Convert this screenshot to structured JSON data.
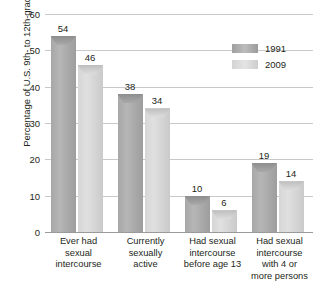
{
  "chart_data": {
    "type": "bar",
    "title": "",
    "xlabel": "",
    "ylabel": "Percentage of U.S. 9th- to 12th-graders",
    "ylim": [
      0,
      60
    ],
    "yticks": [
      0,
      10,
      20,
      30,
      40,
      50,
      60
    ],
    "grid": true,
    "legend_position": "top-right",
    "categories": [
      "Ever had sexual intercourse",
      "Currently sexually active",
      "Had sexual intercourse before age 13",
      "Had sexual intercourse with 4 or more persons"
    ],
    "category_lines": [
      [
        "Ever had",
        "sexual",
        "intercourse"
      ],
      [
        "Currently",
        "sexually",
        "active"
      ],
      [
        "Had sexual",
        "intercourse",
        "before age 13"
      ],
      [
        "Had sexual",
        "intercourse",
        "with 4 or",
        "more persons"
      ]
    ],
    "series": [
      {
        "name": "1991",
        "color": "#a9a9a9",
        "values": [
          54,
          38,
          10,
          19
        ]
      },
      {
        "name": "2009",
        "color": "#d8d8d8",
        "values": [
          46,
          34,
          6,
          14
        ]
      }
    ]
  },
  "legend": {
    "items": [
      {
        "label": "1991"
      },
      {
        "label": "2009"
      }
    ]
  },
  "axis": {
    "y_title": "Percentage of U.S. 9th- to 12th-graders",
    "tick_labels": [
      "60",
      "50",
      "40",
      "30",
      "20",
      "10",
      "0"
    ]
  }
}
